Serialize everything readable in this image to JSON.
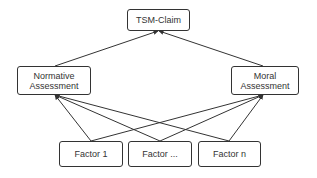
{
  "diagram": {
    "type": "hierarchy",
    "nodes": {
      "claim": {
        "label": "TSM-Claim"
      },
      "normative": {
        "line1": "Normative",
        "line2": "Assessment"
      },
      "moral": {
        "line1": "Moral",
        "line2": "Assessment"
      },
      "factor1": {
        "label": "Factor 1"
      },
      "factor_mid": {
        "label": "Factor ..."
      },
      "factor_n": {
        "label": "Factor n"
      }
    },
    "edges": [
      [
        "normative",
        "claim"
      ],
      [
        "moral",
        "claim"
      ],
      [
        "factor1",
        "normative"
      ],
      [
        "factor_mid",
        "normative"
      ],
      [
        "factor_n",
        "normative"
      ],
      [
        "factor1",
        "moral"
      ],
      [
        "factor_mid",
        "moral"
      ],
      [
        "factor_n",
        "moral"
      ]
    ],
    "colors": {
      "stroke": "#333333",
      "background": "#ffffff",
      "text": "#333333"
    }
  }
}
